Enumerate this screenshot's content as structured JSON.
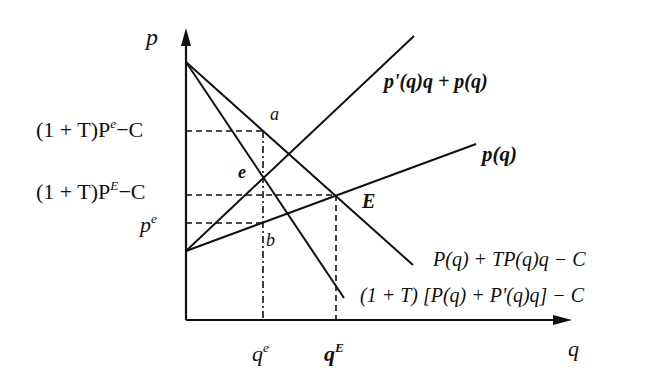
{
  "diagram": {
    "type": "economics-price-quantity",
    "axes": {
      "y_label": "p",
      "x_label": "q"
    },
    "curves": [
      {
        "id": "marginal-revenue-curve",
        "label": "p'(q)q + p(q)"
      },
      {
        "id": "demand-curve",
        "label": "p(q)"
      },
      {
        "id": "tax-adjusted-price-curve",
        "label": "P(q) + TP(q)q − C"
      },
      {
        "id": "tax-adjusted-mr-curve",
        "label": "(1 + T) [P(q) + P'(q)q] − C"
      }
    ],
    "y_ticks": {
      "upper_base": "(1 + T)P",
      "upper_sup": "e",
      "upper_tail": "−C",
      "middle_base": "(1 + T)P",
      "middle_sup": "E",
      "middle_tail": "−C",
      "lower_base": "p",
      "lower_sup": "e"
    },
    "x_ticks": {
      "left_base": "q",
      "left_sup": "e",
      "right_base": "q",
      "right_sup": "E"
    },
    "points": {
      "a": "a",
      "e": "e",
      "b": "b",
      "E": "E"
    }
  }
}
